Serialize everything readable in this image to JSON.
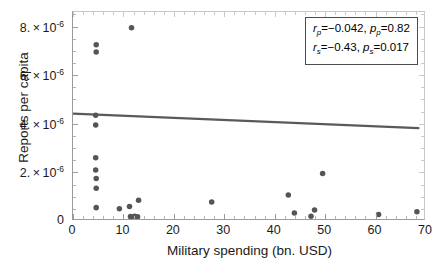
{
  "chart_data": {
    "type": "scatter",
    "title": "",
    "xlabel": "Military spending (bn. USD)",
    "ylabel": "Reports per capita",
    "xlim": [
      0,
      70
    ],
    "ylim": [
      0,
      8.6e-06
    ],
    "grid": false,
    "xticks": [
      0,
      10,
      20,
      30,
      40,
      50,
      60,
      70
    ],
    "xticklabels": [
      "0",
      "10",
      "20",
      "30",
      "40",
      "50",
      "60",
      "70"
    ],
    "yticks": [
      0,
      2e-06,
      4e-06,
      6e-06,
      8e-06
    ],
    "yticklabels": [
      "0",
      "2.×10",
      "4.×10",
      "6.×10",
      "8.×10"
    ],
    "ytick_exponent": "-6",
    "marker_color": "#555555",
    "marker_size": 4,
    "points": [
      {
        "x": 4.6,
        "y": 7.25e-06
      },
      {
        "x": 4.6,
        "y": 6.95e-06
      },
      {
        "x": 11.6,
        "y": 7.95e-06
      },
      {
        "x": 4.5,
        "y": 4.35e-06
      },
      {
        "x": 4.5,
        "y": 3.95e-06
      },
      {
        "x": 4.5,
        "y": 2.6e-06
      },
      {
        "x": 4.5,
        "y": 2.1e-06
      },
      {
        "x": 4.6,
        "y": 1.75e-06
      },
      {
        "x": 4.6,
        "y": 1.35e-06
      },
      {
        "x": 4.6,
        "y": 5.5e-07
      },
      {
        "x": 9.2,
        "y": 5e-07
      },
      {
        "x": 11.2,
        "y": 6e-07
      },
      {
        "x": 13.0,
        "y": 8.5e-07
      },
      {
        "x": 11.4,
        "y": 1.8e-07
      },
      {
        "x": 11.8,
        "y": 1.4e-07
      },
      {
        "x": 12.2,
        "y": 2e-07
      },
      {
        "x": 12.5,
        "y": 1.2e-07
      },
      {
        "x": 12.8,
        "y": 1.7e-07
      },
      {
        "x": 11.9,
        "y": 6e-08
      },
      {
        "x": 12.4,
        "y": 5e-08
      },
      {
        "x": 27.5,
        "y": 7.8e-07
      },
      {
        "x": 42.7,
        "y": 1.07e-06
      },
      {
        "x": 43.9,
        "y": 3.3e-07
      },
      {
        "x": 47.2,
        "y": 2e-07
      },
      {
        "x": 47.9,
        "y": 4.5e-07
      },
      {
        "x": 49.5,
        "y": 1.95e-06
      },
      {
        "x": 60.6,
        "y": 2.7e-07
      },
      {
        "x": 68.2,
        "y": 3.8e-07
      }
    ],
    "trendline": {
      "color": "#5a5a5a",
      "x_start": 0.0,
      "y_start": 4.42e-06,
      "x_end": 68.5,
      "y_end": 3.82e-06
    },
    "annotation_box": {
      "line1": {
        "stat": "r",
        "stat_sub": "p",
        "stat_value": "=−0.042,",
        "p": "p",
        "p_sub": "p",
        "p_value": "=0.82"
      },
      "line2": {
        "stat": "r",
        "stat_sub": "s",
        "stat_value": "=−0.43,",
        "p": "p",
        "p_sub": "s",
        "p_value": "=0.017"
      }
    }
  }
}
